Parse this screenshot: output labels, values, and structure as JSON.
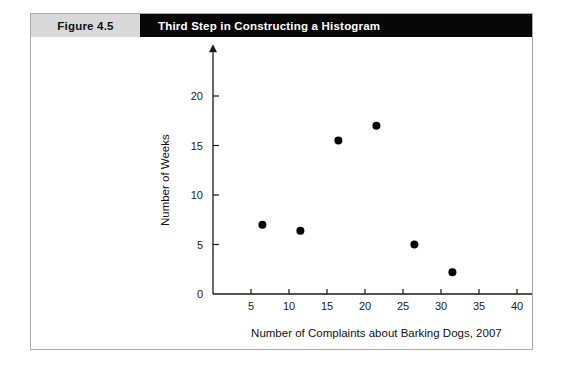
{
  "figure": {
    "label": "Figure 4.5",
    "title": "Third Step in Constructing a Histogram"
  },
  "chart_data": {
    "type": "scatter",
    "title": "Third Step in Constructing a Histogram",
    "xlabel": "Number of Complaints about Barking Dogs, 2007",
    "ylabel": "Number of Weeks",
    "xlim": [
      0,
      43
    ],
    "ylim": [
      0,
      23
    ],
    "xticks": [
      5,
      10,
      15,
      20,
      25,
      30,
      35,
      40
    ],
    "yticks": [
      0,
      5,
      10,
      15,
      20
    ],
    "xtick_labels": [
      "5",
      "10",
      "15",
      "20",
      "25",
      "30",
      "35",
      "40"
    ],
    "ytick_labels": [
      "0",
      "5",
      "10",
      "15",
      "20"
    ],
    "grid": false,
    "legend": "none",
    "marker": "filled-circle",
    "marker_color": "#000000",
    "points": [
      {
        "x": 6.5,
        "y": 7
      },
      {
        "x": 11.5,
        "y": 6.4
      },
      {
        "x": 16.5,
        "y": 15.5
      },
      {
        "x": 21.5,
        "y": 17
      },
      {
        "x": 26.5,
        "y": 5
      },
      {
        "x": 31.5,
        "y": 2.2
      }
    ]
  }
}
